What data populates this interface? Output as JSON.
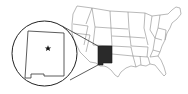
{
  "map": {
    "subject": "United States",
    "highlighted_state": "New Mexico",
    "marker": "capital-star",
    "colors": {
      "background": "#ffffff",
      "state_fill": "#ffffff",
      "state_border": "#8a8a8a",
      "highlight_fill": "#2a2a2a",
      "inset_border": "#222222"
    },
    "inset": {
      "shape": "circle",
      "content": "New Mexico",
      "marker_icon": "star-icon"
    }
  }
}
